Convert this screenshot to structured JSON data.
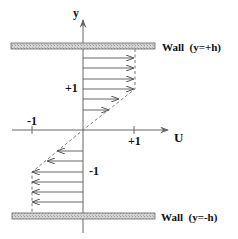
{
  "axes": {
    "y_label": "y",
    "x_label": "U",
    "x_ticks": [
      {
        "label": "-1",
        "value": -1
      },
      {
        "label": "+1",
        "value": 1
      }
    ],
    "y_ticks": [
      {
        "label": "+1",
        "value": 1
      },
      {
        "label": "-1",
        "value": -1
      }
    ]
  },
  "walls": {
    "top": {
      "label": "Wall  (y=+h)"
    },
    "bottom": {
      "label": "Wall  (y=-h)"
    }
  },
  "colors": {
    "wall_fill": "#c8c8c8",
    "line": "#555555",
    "text": "#111111"
  },
  "profile": {
    "description": "Velocity arrows: +1 in upper region, linear through origin, -1 in lower region",
    "upper_arrows_u": [
      1,
      1,
      1,
      1,
      0.7,
      0.5
    ],
    "lower_arrows_u": [
      -0.5,
      -0.7,
      -1,
      -1,
      -1,
      -1
    ]
  }
}
